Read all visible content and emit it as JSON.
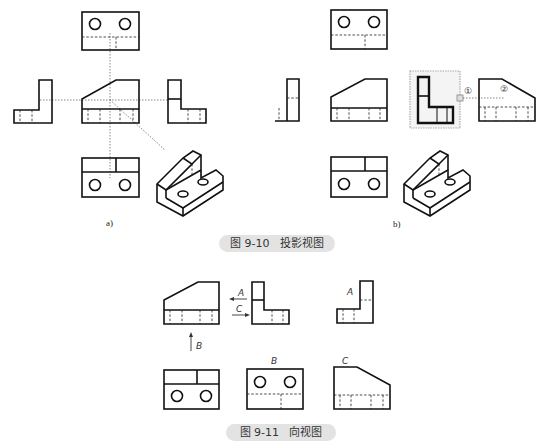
{
  "figures": [
    {
      "id": "fig-9-10",
      "caption": "图 9-10   投影视图",
      "panels": [
        {
          "label": "a)"
        },
        {
          "label": "b)",
          "markers": [
            "①",
            "②"
          ]
        }
      ]
    },
    {
      "id": "fig-9-11",
      "caption": "图 9-11   向视图",
      "arrows": [
        "A",
        "C",
        "B"
      ],
      "view_labels": [
        "A",
        "B",
        "C"
      ]
    }
  ]
}
